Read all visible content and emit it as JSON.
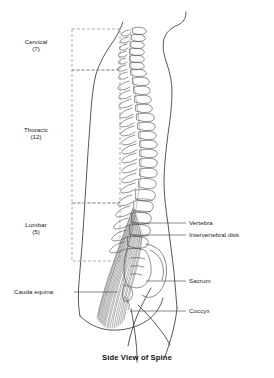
{
  "figure": {
    "caption": "Side View of Spine",
    "view": "lateral",
    "background_color": "#ffffff",
    "line_color": "#3a3a3a",
    "dashed_color": "#8a8a8a",
    "leader_color": "#4a4a4a"
  },
  "regions": [
    {
      "name": "cervical",
      "label": "Cervical",
      "count_label": "(7)",
      "vertebra_count": 7,
      "box": {
        "x": 72,
        "y": 29,
        "width": 48,
        "height": 41
      },
      "label_x": 36,
      "label_y": 42
    },
    {
      "name": "thoracic",
      "label": "Thoracic",
      "count_label": "(12)",
      "vertebra_count": 12,
      "box": {
        "x": 72,
        "y": 70,
        "width": 48,
        "height": 133
      },
      "label_x": 36,
      "label_y": 130
    },
    {
      "name": "lumbar",
      "label": "Lumbar",
      "count_label": "(5)",
      "vertebra_count": 5,
      "box": {
        "x": 72,
        "y": 203,
        "width": 48,
        "height": 58
      },
      "label_x": 36,
      "label_y": 225
    }
  ],
  "callouts": [
    {
      "name": "vertebra",
      "label": "Vertebra",
      "side": "right",
      "label_x": 188,
      "label_y": 220,
      "leader": {
        "x1": 186,
        "y1": 223,
        "x2": 140,
        "y2": 223
      }
    },
    {
      "name": "intervertebral-disk",
      "label": "Intervertebral disk",
      "side": "right",
      "label_x": 188,
      "label_y": 232,
      "leader": {
        "x1": 186,
        "y1": 235,
        "x2": 142,
        "y2": 235
      }
    },
    {
      "name": "sacrum",
      "label": "Sacrum",
      "side": "right",
      "label_x": 188,
      "label_y": 278,
      "leader": {
        "x1": 186,
        "y1": 281,
        "x2": 146,
        "y2": 281
      }
    },
    {
      "name": "coccyx",
      "label": "Coccyx",
      "side": "right",
      "label_x": 188,
      "label_y": 308,
      "leader": {
        "x1": 186,
        "y1": 311,
        "x2": 130,
        "y2": 311
      }
    },
    {
      "name": "cauda-equina",
      "label": "Cauda equina",
      "side": "left",
      "label_x": 14,
      "label_y": 289,
      "leader": {
        "x1": 74,
        "y1": 292,
        "x2": 118,
        "y2": 292
      }
    }
  ]
}
